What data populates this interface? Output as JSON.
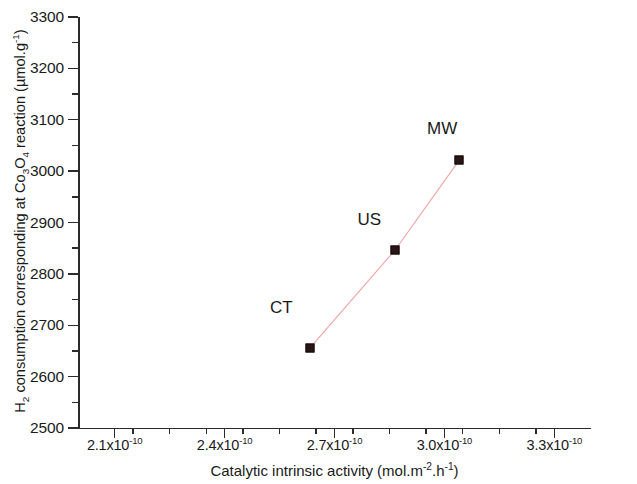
{
  "chart_data": {
    "type": "scatter",
    "title": "",
    "xlabel": "Catalytic intrinsic activity (mol.m-2.h-1)",
    "ylabel": "H2 consumption corresponding at Co3O4 reaction (umol.g-1)",
    "xlim": [
      2e-10,
      3.4e-10
    ],
    "ylim": [
      2500,
      3300
    ],
    "grid": false,
    "legend": null,
    "x_tick_labels": [
      "2.1x10",
      "2.4x10",
      "2.7x10",
      "3.0x10",
      "3.3x10"
    ],
    "x_tick_exponents": [
      "-10",
      "-10",
      "-10",
      "-10",
      "-10"
    ],
    "x_tick_values": [
      2.1e-10,
      2.4e-10,
      2.7e-10,
      3e-10,
      3.3e-10
    ],
    "y_tick_labels": [
      "2500",
      "2600",
      "2700",
      "2800",
      "2900",
      "3000",
      "3100",
      "3200",
      "3300"
    ],
    "y_tick_values": [
      2500,
      2600,
      2700,
      2800,
      2900,
      3000,
      3100,
      3200,
      3300
    ],
    "x_minor_ticks": [
      2.15e-10,
      2.25e-10,
      2.35e-10,
      2.45e-10,
      2.55e-10,
      2.65e-10,
      2.75e-10,
      2.85e-10,
      2.95e-10,
      3.05e-10,
      3.15e-10,
      3.25e-10
    ],
    "y_minor_ticks": [
      2550,
      2650,
      2750,
      2850,
      2950,
      3050,
      3150,
      3250
    ],
    "series": [
      {
        "name": "catalysts",
        "line_color": "#f0a3a3",
        "marker_color": "#2a1515",
        "marker": "square",
        "points": [
          {
            "label": "CT",
            "x": 2.632e-10,
            "y": 2655
          },
          {
            "label": "US",
            "x": 2.866e-10,
            "y": 2847
          },
          {
            "label": "MW",
            "x": 3.041e-10,
            "y": 3022
          }
        ]
      }
    ],
    "annotations": [
      {
        "text": "CT",
        "x": 2.555e-10,
        "y": 2734
      },
      {
        "text": "US",
        "x": 2.795e-10,
        "y": 2905
      },
      {
        "text": "MW",
        "x": 2.994e-10,
        "y": 3082
      }
    ]
  },
  "axis": {
    "x_title_prefix": "Catalytic intrinsic activity (mol.m",
    "x_title_exp1": "-2",
    "x_title_mid": ".h",
    "x_title_exp2": "-1",
    "x_title_suffix": ")",
    "y_title_prefix": "H",
    "y_title_sub1": "2",
    "y_title_mid1": " consumption corresponding at Co",
    "y_title_sub2": "3",
    "y_title_mid2": "O",
    "y_title_sub3": "4",
    "y_title_mid3": " reaction (µmol.g",
    "y_title_exp": "-1",
    "y_title_suffix": ")"
  }
}
